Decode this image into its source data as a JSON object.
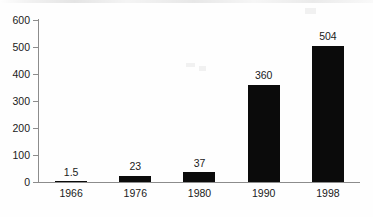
{
  "chart_data": {
    "type": "bar",
    "title": "",
    "subtitle": "",
    "xlabel": "",
    "ylabel": "",
    "categories": [
      "1966",
      "1976",
      "1980",
      "1990",
      "1998"
    ],
    "values": [
      1.5,
      23,
      37,
      360,
      504
    ],
    "value_labels": [
      "1.5",
      "23",
      "37",
      "360",
      "504"
    ],
    "series": [
      {
        "name": "",
        "values": [
          1.5,
          23,
          37,
          360,
          504
        ]
      }
    ],
    "ylim": [
      0,
      600
    ],
    "xlim_categories": 5,
    "y_ticks": [
      0,
      100,
      200,
      300,
      400,
      500,
      600
    ],
    "y_tick_labels": [
      "0",
      "100",
      "200",
      "300",
      "400",
      "500",
      "600"
    ],
    "grid": false,
    "legend": false,
    "legend_position": "none",
    "bar_color": "#0b0b0b",
    "axis_color": "#8c8c8c",
    "background_color": "#fefefe",
    "text_color": "#1a1a1a",
    "data_labels_shown": true,
    "data_label_position": "above-bar"
  }
}
